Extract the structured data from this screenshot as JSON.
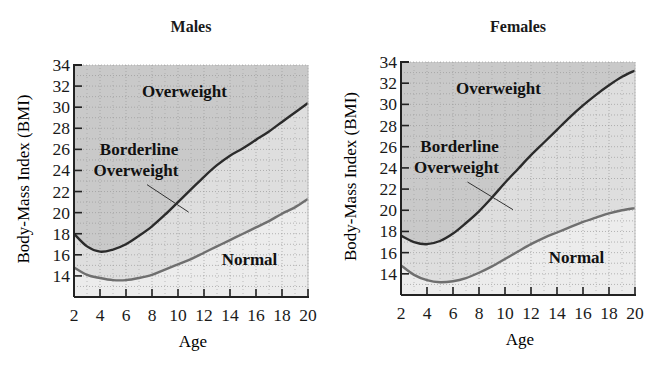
{
  "chart_data": [
    {
      "type": "area",
      "title": "Males",
      "xlabel": "Age",
      "ylabel": "Body-Mass Index (BMI)",
      "xlim": [
        2,
        20
      ],
      "ylim": [
        12,
        34
      ],
      "xticks": [
        2,
        4,
        6,
        8,
        10,
        12,
        14,
        16,
        18,
        20
      ],
      "yticks": [
        14,
        16,
        18,
        20,
        22,
        24,
        26,
        28,
        30,
        32,
        34
      ],
      "grid": true,
      "legend": "none",
      "x": [
        2,
        3,
        4,
        5,
        6,
        7,
        8,
        9,
        10,
        11,
        12,
        13,
        14,
        15,
        16,
        17,
        18,
        19,
        20
      ],
      "series": [
        {
          "name": "Overweight threshold (upper curve)",
          "values": [
            18.0,
            16.8,
            16.3,
            16.5,
            17.0,
            17.8,
            18.7,
            19.8,
            21.0,
            22.2,
            23.4,
            24.5,
            25.4,
            26.1,
            26.9,
            27.7,
            28.6,
            29.5,
            30.4
          ]
        },
        {
          "name": "Borderline threshold (lower curve)",
          "values": [
            14.8,
            14.1,
            13.8,
            13.6,
            13.6,
            13.8,
            14.1,
            14.6,
            15.1,
            15.6,
            16.2,
            16.8,
            17.4,
            18.0,
            18.6,
            19.2,
            19.9,
            20.5,
            21.3
          ]
        }
      ],
      "annotations": [
        {
          "text": "Overweight",
          "region": "above upper curve",
          "x": 10.5,
          "y": 31.0
        },
        {
          "text": "Borderline Overweight",
          "region": "between curves",
          "x": 7.0,
          "y": 25.5,
          "leader_to": [
            10.2,
            21.0
          ]
        },
        {
          "text": "Normal",
          "region": "below lower curve",
          "x": 15.5,
          "y": 15.0
        }
      ]
    },
    {
      "type": "area",
      "title": "Females",
      "xlabel": "Age",
      "ylabel": "Body-Mass Index (BMI)",
      "xlim": [
        2,
        20
      ],
      "ylim": [
        12,
        34
      ],
      "xticks": [
        2,
        4,
        6,
        8,
        10,
        12,
        14,
        16,
        18,
        20
      ],
      "yticks": [
        14,
        16,
        18,
        20,
        22,
        24,
        26,
        28,
        30,
        32,
        34
      ],
      "grid": true,
      "legend": "none",
      "x": [
        2,
        3,
        4,
        5,
        6,
        7,
        8,
        9,
        10,
        11,
        12,
        13,
        14,
        15,
        16,
        17,
        18,
        19,
        20
      ],
      "series": [
        {
          "name": "Overweight threshold (upper curve)",
          "values": [
            17.6,
            17.0,
            16.8,
            17.1,
            17.8,
            18.8,
            19.9,
            21.2,
            22.6,
            23.9,
            25.2,
            26.4,
            27.6,
            28.8,
            29.9,
            30.9,
            31.8,
            32.6,
            33.2
          ]
        },
        {
          "name": "Borderline threshold (lower curve)",
          "values": [
            14.8,
            13.9,
            13.4,
            13.2,
            13.3,
            13.6,
            14.1,
            14.7,
            15.4,
            16.1,
            16.8,
            17.4,
            17.9,
            18.4,
            18.9,
            19.3,
            19.7,
            20.0,
            20.2
          ]
        }
      ],
      "annotations": [
        {
          "text": "Overweight",
          "region": "above upper curve",
          "x": 9.5,
          "y": 31.0
        },
        {
          "text": "Borderline Overweight",
          "region": "between curves",
          "x": 6.5,
          "y": 25.5,
          "leader_to": [
            10.0,
            21.0
          ]
        },
        {
          "text": "Normal",
          "region": "below lower curve",
          "x": 15.5,
          "y": 15.0
        }
      ]
    }
  ],
  "panels": [
    {
      "title": "Males",
      "xlabel": "Age",
      "ylabel": "Body-Mass Index (BMI)",
      "labels": {
        "overweight": "Overweight",
        "borderline_1": "Borderline",
        "borderline_2": "Overweight",
        "normal": "Normal"
      }
    },
    {
      "title": "Females",
      "xlabel": "Age",
      "ylabel": "Body-Mass Index (BMI)",
      "labels": {
        "overweight": "Overweight",
        "borderline_1": "Borderline",
        "borderline_2": "Overweight",
        "normal": "Normal"
      }
    }
  ],
  "colors": {
    "overweight_fill": "#c9c9c9",
    "borderline_fill": "#dedede",
    "normal_fill": "#ececec",
    "upper_curve": "#2b2b2b",
    "lower_curve": "#6f6f6f",
    "grid": "#9a9a9a",
    "axis": "#222222"
  }
}
